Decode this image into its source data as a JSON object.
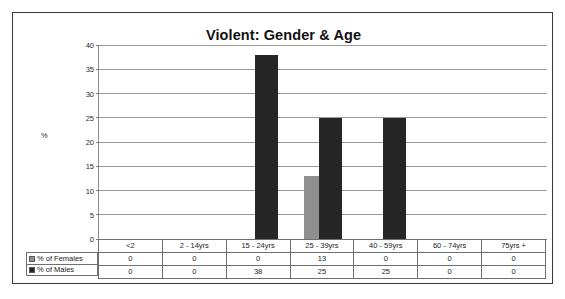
{
  "chart_data": {
    "type": "bar",
    "title": "Violent: Gender & Age",
    "xlabel": "",
    "ylabel": "%",
    "ylim": [
      0,
      40
    ],
    "ytick_step": 5,
    "yticks": [
      40,
      35,
      30,
      25,
      20,
      15,
      10,
      5,
      0
    ],
    "grid": true,
    "legend_position": "table-left",
    "categories": [
      "<2",
      "2 - 14yrs",
      "15 - 24yrs",
      "25 - 39yrs",
      "40 - 59yrs",
      "60 - 74yrs",
      "75yrs +"
    ],
    "series": [
      {
        "name": "% of Females",
        "color": "#8f8f8f",
        "values": [
          0,
          0,
          0,
          13,
          0,
          0,
          0
        ]
      },
      {
        "name": "% of Males",
        "color": "#262626",
        "values": [
          0,
          0,
          38,
          25,
          25,
          0,
          0
        ]
      }
    ]
  },
  "table": {
    "header_row_label": "",
    "columns": [
      "<2",
      "2 - 14yrs",
      "15 - 24yrs",
      "25 - 39yrs",
      "40 - 59yrs",
      "60 - 74yrs",
      "75yrs +"
    ],
    "rows": [
      {
        "label": "% of Females",
        "swatch": "#8f8f8f",
        "cells": [
          "0",
          "0",
          "0",
          "13",
          "0",
          "0",
          "0"
        ]
      },
      {
        "label": "% of Males",
        "swatch": "#262626",
        "cells": [
          "0",
          "0",
          "38",
          "25",
          "25",
          "0",
          "0"
        ]
      }
    ]
  },
  "axis": {
    "y_label": "%",
    "y_ticks": [
      "40",
      "35",
      "30",
      "25",
      "20",
      "15",
      "10",
      "5",
      "0"
    ]
  }
}
